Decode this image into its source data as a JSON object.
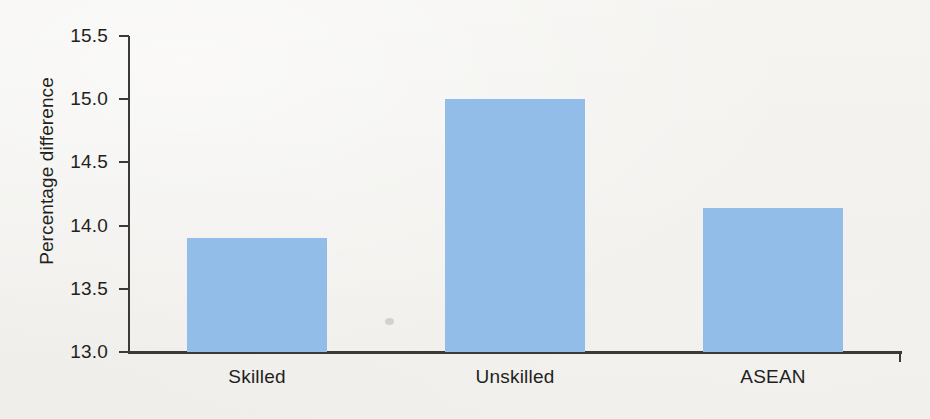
{
  "chart_data": {
    "type": "bar",
    "title": "",
    "subtitle": "",
    "xlabel": "",
    "ylabel": "Percentage difference",
    "categories": [
      "Skilled",
      "Unskilled",
      "ASEAN"
    ],
    "values": [
      13.9,
      15.0,
      14.14
    ],
    "series": [
      {
        "name": "Percentage difference",
        "values": [
          13.9,
          15.0,
          14.14
        ],
        "color": "#92bde9"
      }
    ],
    "ylim": [
      13.0,
      15.5
    ],
    "y_ticks": [
      "13.0",
      "13.5",
      "14.0",
      "14.5",
      "15.0",
      "15.5"
    ],
    "y_tick_values": [
      13.0,
      13.5,
      14.0,
      14.5,
      15.0,
      15.5
    ],
    "grid": false,
    "legend": false,
    "legend_position": "none",
    "bar_color": "#92bde9",
    "axis_color": "#3a3a38",
    "background_color": "#f3f2ef",
    "text_color": "#231f20"
  },
  "axis": {
    "y_title": "Percentage difference",
    "ticks": [
      {
        "label": "15.5",
        "value": 15.5
      },
      {
        "label": "15.0",
        "value": 15.0
      },
      {
        "label": "14.5",
        "value": 14.5
      },
      {
        "label": "14.0",
        "value": 14.0
      },
      {
        "label": "13.5",
        "value": 13.5
      },
      {
        "label": "13.0",
        "value": 13.0
      }
    ]
  },
  "bars": [
    {
      "label": "Skilled",
      "value": 13.9
    },
    {
      "label": "Unskilled",
      "value": 15.0
    },
    {
      "label": "ASEAN",
      "value": 14.14
    }
  ]
}
